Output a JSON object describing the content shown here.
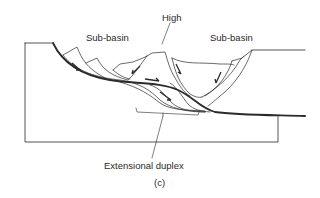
{
  "diagram": {
    "labels": {
      "high": "High",
      "sub_basin_left": "Sub-basin",
      "sub_basin_right": "Sub-basin",
      "extensional_duplex": "Extensional duplex",
      "panel": "(c)"
    },
    "colors": {
      "line": "#2a2a2a",
      "background": "#ffffff"
    }
  }
}
